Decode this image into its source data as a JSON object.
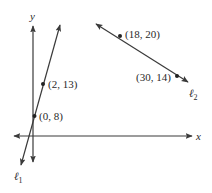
{
  "diagram": {
    "axes": {
      "x_label": "x",
      "y_label": "y"
    },
    "lines": [
      {
        "name": "ℓ",
        "subscript": "1",
        "points": [
          {
            "label": "(2, 13)",
            "x": 2,
            "y": 13
          },
          {
            "label": "(0, 8)",
            "x": 0,
            "y": 8
          }
        ]
      },
      {
        "name": "ℓ",
        "subscript": "2",
        "points": [
          {
            "label": "(18, 20)",
            "x": 18,
            "y": 20
          },
          {
            "label": "(30, 14)",
            "x": 30,
            "y": 14
          }
        ]
      }
    ],
    "colors": {
      "line": "#3a3a3a",
      "text": "#2a2a2a"
    }
  }
}
